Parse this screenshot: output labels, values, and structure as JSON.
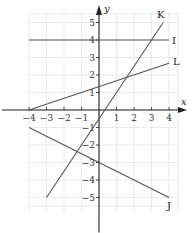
{
  "chart_data": {
    "type": "line",
    "title": "",
    "xlabel": "x",
    "ylabel": "y",
    "xlim": [
      -4,
      4
    ],
    "ylim": [
      -5,
      5
    ],
    "grid": true,
    "x_ticks": [
      -4,
      -3,
      -2,
      -1,
      1,
      2,
      3,
      4
    ],
    "y_ticks": [
      -5,
      -4,
      -3,
      -2,
      -1,
      1,
      2,
      3,
      4,
      5
    ],
    "x_tick_labels": [
      "−4",
      "−3",
      "−2",
      "−1",
      "1",
      "2",
      "3",
      "4"
    ],
    "y_tick_labels": [
      "−5",
      "−4",
      "−3",
      "−2",
      "−1",
      "1",
      "2",
      "3",
      "4",
      "5"
    ],
    "series": [
      {
        "name": "I",
        "equation": "y = 4",
        "points": [
          [
            -4,
            4
          ],
          [
            4,
            4
          ]
        ],
        "color": "#555555"
      },
      {
        "name": "K",
        "equation": "y = 1.5x - 0.5",
        "points": [
          [
            -3,
            -5
          ],
          [
            3.67,
            5
          ]
        ],
        "color": "#555555"
      },
      {
        "name": "L",
        "equation": "y = (x + 4)/3",
        "points": [
          [
            -4,
            0
          ],
          [
            4,
            2.67
          ]
        ],
        "color": "#555555"
      },
      {
        "name": "J",
        "equation": "y = -0.5x - 3",
        "points": [
          [
            -4,
            -1
          ],
          [
            4,
            -5
          ]
        ],
        "color": "#555555"
      }
    ],
    "colors": {
      "axis": "#222222",
      "grid": "#e6e6e6",
      "line": "#555555"
    }
  }
}
